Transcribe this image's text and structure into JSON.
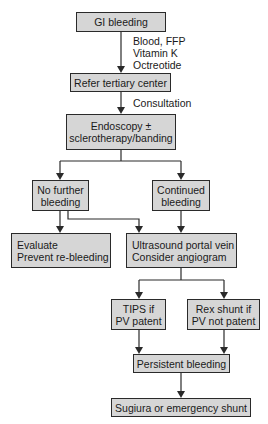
{
  "flowchart": {
    "nodes": {
      "gi_bleeding": {
        "lines": [
          "GI bleeding"
        ]
      },
      "refer": {
        "lines": [
          "Refer tertiary center"
        ]
      },
      "endoscopy": {
        "lines": [
          "Endoscopy ±",
          "sclerotherapy/banding"
        ]
      },
      "no_further": {
        "lines": [
          "No further",
          "bleeding"
        ]
      },
      "continued": {
        "lines": [
          "Continued",
          "bleeding"
        ]
      },
      "evaluate": {
        "lines": [
          "Evaluate",
          "Prevent re-bleeding"
        ]
      },
      "ultrasound": {
        "lines": [
          "Ultrasound portal vein",
          "Consider angiogram"
        ]
      },
      "tips": {
        "lines": [
          "TIPS if",
          "PV patent"
        ]
      },
      "rex": {
        "lines": [
          "Rex shunt if",
          "PV not patent"
        ]
      },
      "persistent": {
        "lines": [
          "Persistent bleeding"
        ]
      },
      "sugiura": {
        "lines": [
          "Sugiura or emergency shunt"
        ]
      }
    },
    "edge_labels": {
      "initial_treatment": [
        "Blood, FFP",
        "Vitamin K",
        "Octreotide"
      ],
      "consultation": [
        "Consultation"
      ]
    },
    "edges": [
      [
        "gi_bleeding",
        "refer"
      ],
      [
        "refer",
        "endoscopy"
      ],
      [
        "endoscopy",
        "no_further"
      ],
      [
        "endoscopy",
        "continued"
      ],
      [
        "no_further",
        "evaluate"
      ],
      [
        "no_further",
        "ultrasound"
      ],
      [
        "continued",
        "ultrasound"
      ],
      [
        "ultrasound",
        "tips"
      ],
      [
        "ultrasound",
        "rex"
      ],
      [
        "tips",
        "persistent"
      ],
      [
        "rex",
        "persistent"
      ],
      [
        "persistent",
        "sugiura"
      ]
    ],
    "colors": {
      "box_fill": "#d6d6d6",
      "border": "#2a2a2a",
      "line": "#2a2a2a"
    }
  }
}
